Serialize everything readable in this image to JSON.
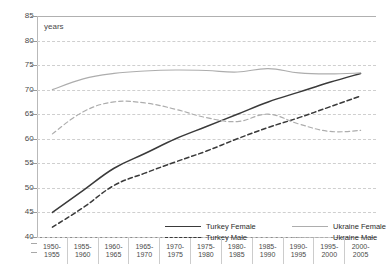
{
  "axis": {
    "y_caption": "years",
    "y_ticks": [
      85,
      80,
      75,
      70,
      65,
      60,
      55,
      50,
      45,
      40
    ],
    "x_categories": [
      {
        "top": "1950-",
        "bottom": "1955"
      },
      {
        "top": "1955-",
        "bottom": "1960"
      },
      {
        "top": "1960-",
        "bottom": "1965"
      },
      {
        "top": "1965-",
        "bottom": "1970"
      },
      {
        "top": "1970-",
        "bottom": "1975"
      },
      {
        "top": "1975-",
        "bottom": "1980"
      },
      {
        "top": "1980-",
        "bottom": "1985"
      },
      {
        "top": "1985-",
        "bottom": "1990"
      },
      {
        "top": "1990-",
        "bottom": "1995"
      },
      {
        "top": "1995-",
        "bottom": "2000"
      },
      {
        "top": "2000-",
        "bottom": "2005"
      }
    ]
  },
  "legend": {
    "turkey_female": "Turkey Female",
    "turkey_male": "Turkey Male",
    "ukraine_female": "Ukraine Female",
    "ukraine_male": "Ukraine Male"
  },
  "colors": {
    "turkey": "#3a3a3a",
    "ukraine": "#adadad",
    "grid": "#cfcfcf",
    "axis": "#8c8c8c",
    "text": "#4a4a4a"
  },
  "chart_data": {
    "type": "line",
    "title": "",
    "xlabel": "",
    "ylabel": "years",
    "ylim": [
      40,
      85
    ],
    "ytick_step": 5,
    "grid": true,
    "legend_position": "bottom-inside",
    "categories": [
      "1950-1955",
      "1955-1960",
      "1960-1965",
      "1965-1970",
      "1970-1975",
      "1975-1980",
      "1980-1985",
      "1985-1990",
      "1990-1995",
      "1995-2000",
      "2000-2005"
    ],
    "series": [
      {
        "name": "Turkey Female",
        "style": "solid",
        "color": "#3a3a3a",
        "values": [
          45.0,
          49.5,
          54.0,
          57.0,
          60.0,
          62.5,
          65.0,
          67.5,
          69.5,
          71.5,
          73.3
        ]
      },
      {
        "name": "Turkey Male",
        "style": "dashed",
        "color": "#3a3a3a",
        "values": [
          42.0,
          46.0,
          50.5,
          53.0,
          55.3,
          57.5,
          60.0,
          62.3,
          64.3,
          66.5,
          68.7
        ]
      },
      {
        "name": "Ukraine Female",
        "style": "solid",
        "color": "#adadad",
        "values": [
          70.0,
          72.2,
          73.3,
          73.8,
          74.0,
          73.9,
          73.6,
          74.3,
          73.4,
          73.2,
          73.4
        ]
      },
      {
        "name": "Ukraine Male",
        "style": "dashed",
        "color": "#adadad",
        "values": [
          61.0,
          65.5,
          67.5,
          67.3,
          66.0,
          64.3,
          63.5,
          65.0,
          63.0,
          61.5,
          61.7
        ]
      }
    ]
  }
}
